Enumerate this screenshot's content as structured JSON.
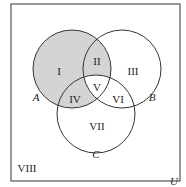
{
  "diagram": {
    "type": "venn",
    "universe_label": "U",
    "sets": [
      {
        "name": "A",
        "label": "A"
      },
      {
        "name": "B",
        "label": "B"
      },
      {
        "name": "C",
        "label": "C"
      }
    ],
    "regions": {
      "I": "I",
      "II": "II",
      "III": "III",
      "IV": "IV",
      "V": "V",
      "VI": "VI",
      "VII": "VII",
      "VIII": "VIII"
    },
    "shaded_regions": [
      "I",
      "II",
      "IV"
    ],
    "colors": {
      "shade": "#d4d4d4",
      "stroke": "#333333",
      "background": "#ffffff"
    }
  }
}
